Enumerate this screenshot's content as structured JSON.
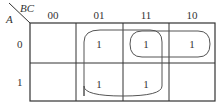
{
  "kmap": {
    "row_variable": "A",
    "column_variables": "BC",
    "column_headers": [
      "00",
      "01",
      "11",
      "10"
    ],
    "row_headers": [
      "0",
      "1"
    ],
    "cells": [
      [
        "",
        "1",
        "1",
        "1"
      ],
      [
        "",
        "1",
        "1",
        ""
      ]
    ],
    "groups": [
      {
        "name": "group-C",
        "rows": [
          0,
          1
        ],
        "columns": [
          "01",
          "11"
        ]
      },
      {
        "name": "group-A'B",
        "rows": [
          0
        ],
        "columns": [
          "11",
          "10"
        ]
      }
    ],
    "colors": {
      "line": "#333333",
      "loop": "#555555",
      "background": "#ffffff"
    }
  }
}
